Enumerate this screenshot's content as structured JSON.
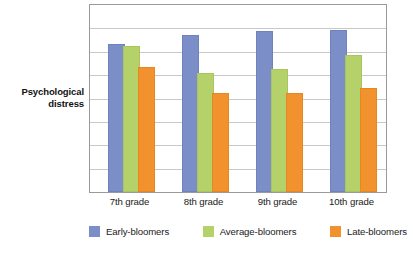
{
  "axis_caption": {
    "line1": "Psychological",
    "line2": "distress"
  },
  "chart_data": {
    "type": "bar",
    "title": "",
    "subtitle": "",
    "xlabel": "",
    "ylabel": "Psychological distress",
    "categories": [
      "7th grade",
      "8th grade",
      "9th grade",
      "10th grade"
    ],
    "series": [
      {
        "name": "Early-bloomers",
        "color": "#7b8ec8",
        "values": [
          6.24,
          6.62,
          6.8,
          6.84
        ]
      },
      {
        "name": "Average-bloomers",
        "color": "#b5d16a",
        "values": [
          6.15,
          5.0,
          5.17,
          5.77
        ]
      },
      {
        "name": "Late-bloomers",
        "color": "#f2922e",
        "values": [
          5.26,
          4.15,
          4.15,
          4.36
        ]
      }
    ],
    "ylim": [
      0,
      8
    ],
    "ytick_labels": [],
    "gridlines": 7,
    "grid": true,
    "legend_position": "bottom",
    "annotations": []
  },
  "legend": {
    "items": [
      {
        "label": "Early-bloomers"
      },
      {
        "label": "Average-bloomers"
      },
      {
        "label": "Late-bloomers"
      }
    ]
  }
}
